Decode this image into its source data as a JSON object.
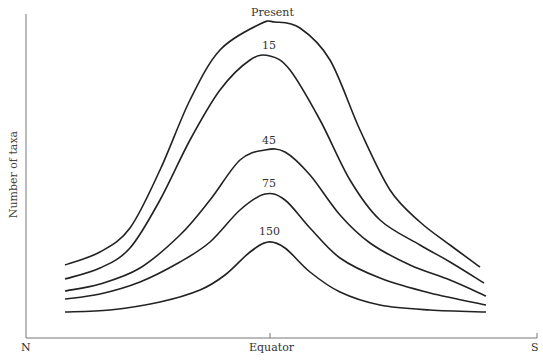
{
  "chart_data": {
    "type": "line",
    "title": "",
    "xlabel": "",
    "ylabel": "Number of taxa",
    "x_tick_labels": [
      "N",
      "Equator",
      "S"
    ],
    "grid": false,
    "legend": "none (curves labeled directly at peaks)",
    "series": [
      {
        "name": "Present",
        "points": [
          [
            65,
            265
          ],
          [
            100,
            252
          ],
          [
            130,
            228
          ],
          [
            160,
            170
          ],
          [
            190,
            100
          ],
          [
            220,
            50
          ],
          [
            260,
            24
          ],
          [
            275,
            22
          ],
          [
            300,
            28
          ],
          [
            330,
            60
          ],
          [
            360,
            130
          ],
          [
            390,
            190
          ],
          [
            420,
            222
          ],
          [
            450,
            245
          ],
          [
            480,
            267
          ]
        ]
      },
      {
        "name": "15",
        "points": [
          [
            65,
            279
          ],
          [
            100,
            268
          ],
          [
            130,
            248
          ],
          [
            160,
            200
          ],
          [
            190,
            140
          ],
          [
            220,
            90
          ],
          [
            250,
            60
          ],
          [
            270,
            56
          ],
          [
            290,
            70
          ],
          [
            320,
            120
          ],
          [
            350,
            180
          ],
          [
            380,
            220
          ],
          [
            420,
            245
          ],
          [
            450,
            262
          ],
          [
            484,
            283
          ]
        ]
      },
      {
        "name": "45",
        "points": [
          [
            65,
            291
          ],
          [
            100,
            284
          ],
          [
            140,
            268
          ],
          [
            180,
            235
          ],
          [
            210,
            200
          ],
          [
            240,
            160
          ],
          [
            265,
            150
          ],
          [
            285,
            152
          ],
          [
            310,
            175
          ],
          [
            340,
            215
          ],
          [
            370,
            243
          ],
          [
            410,
            265
          ],
          [
            450,
            280
          ],
          [
            486,
            296
          ]
        ]
      },
      {
        "name": "75",
        "points": [
          [
            65,
            299
          ],
          [
            100,
            294
          ],
          [
            140,
            282
          ],
          [
            180,
            262
          ],
          [
            210,
            242
          ],
          [
            240,
            210
          ],
          [
            265,
            194
          ],
          [
            285,
            200
          ],
          [
            310,
            228
          ],
          [
            340,
            258
          ],
          [
            380,
            278
          ],
          [
            430,
            293
          ],
          [
            486,
            305
          ]
        ]
      },
      {
        "name": "150",
        "points": [
          [
            65,
            312
          ],
          [
            110,
            310
          ],
          [
            160,
            302
          ],
          [
            200,
            290
          ],
          [
            225,
            275
          ],
          [
            250,
            252
          ],
          [
            268,
            242
          ],
          [
            285,
            248
          ],
          [
            310,
            272
          ],
          [
            340,
            292
          ],
          [
            380,
            305
          ],
          [
            430,
            310
          ],
          [
            486,
            312
          ]
        ]
      }
    ],
    "axis_pixels": {
      "x0": 26,
      "x1": 537,
      "y_axis_top": 14,
      "baseline": 338,
      "equator_x": 270
    }
  },
  "labels": {
    "ylabel": "Number of taxa",
    "north": "N",
    "equator": "Equator",
    "south": "S",
    "present": "Present",
    "c15": "15",
    "c45": "45",
    "c75": "75",
    "c150": "150"
  }
}
